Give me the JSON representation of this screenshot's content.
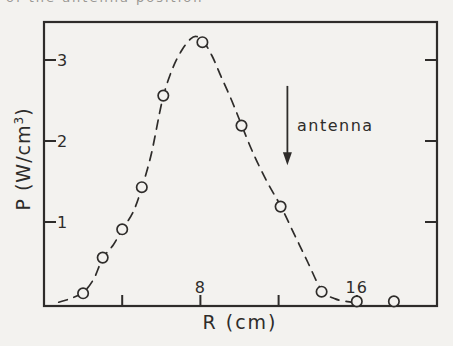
{
  "page": {
    "background_color": "#f3f2ef",
    "ink_color": "#2e2c2a",
    "clipped_text_top": "of the antenna position"
  },
  "chart_data": {
    "type": "scatter",
    "title": "",
    "xlabel": "R (cm)",
    "ylabel_prefix": "P (W/cm",
    "ylabel_sup": "3",
    "ylabel_suffix": ")",
    "xlim": [
      0,
      20.1
    ],
    "ylim": [
      0,
      3.5
    ],
    "grid": false,
    "x_ticks": [
      {
        "value": 4,
        "label": ""
      },
      {
        "value": 8,
        "label": "8"
      },
      {
        "value": 12,
        "label": ""
      },
      {
        "value": 16,
        "label": "16"
      }
    ],
    "y_ticks": [
      {
        "value": 1,
        "label": "1"
      },
      {
        "value": 2,
        "label": "2"
      },
      {
        "value": 3,
        "label": "3"
      }
    ],
    "series": [
      {
        "name": "measured power density",
        "marker": "open-circle",
        "points": [
          {
            "r": 2.0,
            "p": 0.12
          },
          {
            "r": 3.0,
            "p": 0.56
          },
          {
            "r": 4.0,
            "p": 0.91
          },
          {
            "r": 5.0,
            "p": 1.43
          },
          {
            "r": 6.1,
            "p": 2.56
          },
          {
            "r": 8.1,
            "p": 3.22
          },
          {
            "r": 10.1,
            "p": 2.19
          },
          {
            "r": 12.1,
            "p": 1.19
          },
          {
            "r": 14.2,
            "p": 0.14
          },
          {
            "r": 16.0,
            "p": 0.02
          },
          {
            "r": 17.9,
            "p": 0.02
          }
        ]
      }
    ],
    "fit_curve": {
      "style": "dashed",
      "points_rp": [
        [
          0.75,
          0.01
        ],
        [
          1.3,
          0.05
        ],
        [
          2.0,
          0.13
        ],
        [
          2.55,
          0.3
        ],
        [
          3.0,
          0.55
        ],
        [
          3.55,
          0.72
        ],
        [
          4.0,
          0.91
        ],
        [
          4.55,
          1.12
        ],
        [
          5.0,
          1.42
        ],
        [
          5.5,
          1.85
        ],
        [
          6.05,
          2.5
        ],
        [
          6.55,
          2.88
        ],
        [
          7.05,
          3.12
        ],
        [
          7.5,
          3.26
        ],
        [
          7.8,
          3.29
        ],
        [
          8.15,
          3.23
        ],
        [
          8.6,
          3.05
        ],
        [
          9.05,
          2.8
        ],
        [
          9.6,
          2.5
        ],
        [
          10.1,
          2.2
        ],
        [
          10.7,
          1.85
        ],
        [
          11.4,
          1.5
        ],
        [
          12.1,
          1.2
        ],
        [
          12.8,
          0.85
        ],
        [
          13.5,
          0.5
        ],
        [
          14.2,
          0.16
        ],
        [
          14.9,
          0.05
        ],
        [
          15.7,
          0.01
        ]
      ]
    },
    "annotation": {
      "label": "antenna",
      "arrow_r": 12.45,
      "arrow_p_from": 2.68,
      "arrow_p_to": 1.7
    }
  }
}
